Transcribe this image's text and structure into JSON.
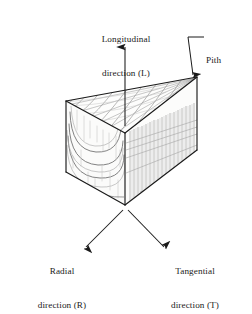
{
  "figure": {
    "name": "wood-anatomical-directions",
    "background_color": "#ffffff",
    "stroke_color": "#1a1a1a",
    "grain_color": "#8c8c8c",
    "faint_grain_color": "#b6b6b6"
  },
  "labels": {
    "longitudinal": {
      "line1": "Longitudinal",
      "line2": "direction (L)"
    },
    "pith": {
      "line1": "Pith"
    },
    "radial": {
      "line1": "Radial",
      "line2": "direction (R)"
    },
    "tangential": {
      "line1": "Tangential",
      "line2": "direction (T)"
    }
  },
  "geometry": {
    "top_back_left": [
      66,
      101
    ],
    "pith_tip": [
      197,
      77
    ],
    "top_front": [
      125,
      133
    ],
    "bottom_back_left": [
      66,
      172
    ],
    "bottom_right": [
      197,
      150
    ],
    "bottom_front": [
      125,
      205
    ]
  },
  "arrows": {
    "longitudinal": {
      "from": [
        125,
        126
      ],
      "to": [
        125,
        46
      ],
      "direction": "up"
    },
    "pith": {
      "leader_from": [
        205,
        37
      ],
      "elbow": [
        187,
        37
      ],
      "to": [
        193,
        74
      ],
      "direction": "down"
    },
    "radial": {
      "from": [
        124,
        209
      ],
      "to": [
        84,
        249
      ],
      "direction": "down-left"
    },
    "tangential": {
      "from": [
        127,
        209
      ],
      "to": [
        166,
        249
      ],
      "direction": "down-right"
    }
  }
}
